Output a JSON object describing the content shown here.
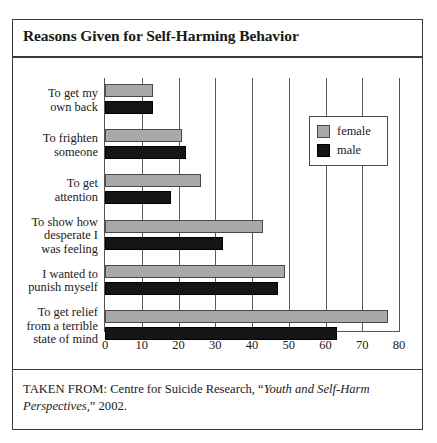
{
  "figure": {
    "title": "Reasons Given for Self-Harming Behavior",
    "source_prefix": "TAKEN FROM: Centre for Suicide Research, “",
    "source_italic": "Youth and Self-Harm Perspectives,",
    "source_suffix": "” 2002."
  },
  "legend": {
    "position": "inside-upper-right",
    "items": [
      {
        "label": "female",
        "color": "#a9a9a9",
        "name": "female"
      },
      {
        "label": "male",
        "color": "#151515",
        "name": "male"
      }
    ]
  },
  "chart_data": {
    "type": "bar",
    "orientation": "horizontal",
    "title": "Reasons Given for Self-Harming Behavior",
    "xlabel": "",
    "ylabel": "",
    "xlim": [
      0,
      80
    ],
    "xticks": [
      0,
      10,
      20,
      30,
      40,
      50,
      60,
      70,
      80
    ],
    "tick_labels": [
      "0",
      "10",
      "20",
      "30",
      "40",
      "50",
      "60",
      "70",
      "80"
    ],
    "grid": "vertical-gridlines-only",
    "categories": [
      "To get my own back",
      "To frighten someone",
      "To get attention",
      "To show how desperate I was feeling",
      "I wanted to punish myself",
      "To get relief from a terrible state of mind"
    ],
    "category_label_lines": [
      [
        "To get my",
        "own back"
      ],
      [
        "To frighten",
        "someone"
      ],
      [
        "To get",
        "attention"
      ],
      [
        "To show how",
        "desperate I",
        "was feeling"
      ],
      [
        "I wanted to",
        "punish myself"
      ],
      [
        "To get relief",
        "from a terrible",
        "state of mind"
      ]
    ],
    "series": [
      {
        "name": "female",
        "color": "#a9a9a9",
        "values": [
          13,
          21,
          26,
          43,
          49,
          77
        ]
      },
      {
        "name": "male",
        "color": "#151515",
        "values": [
          13,
          22,
          18,
          32,
          47,
          63
        ]
      }
    ]
  }
}
